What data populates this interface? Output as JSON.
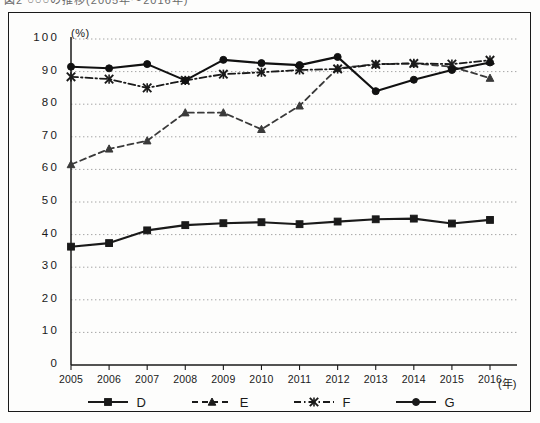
{
  "caption_sliver": "図2  ○○○の推移(2005年〜2016年)",
  "axis": {
    "y_unit": "(%)",
    "x_unit": "(年)",
    "y_ticks": [
      "100",
      "90",
      "80",
      "70",
      "60",
      "50",
      "40",
      "30",
      "20",
      "10",
      "0"
    ],
    "x_ticks": [
      "2005",
      "2006",
      "2007",
      "2008",
      "2009",
      "2010",
      "2011",
      "2012",
      "2013",
      "2014",
      "2015",
      "2016"
    ]
  },
  "legend": {
    "items": [
      {
        "label": "D",
        "marker": "square",
        "line": "solid"
      },
      {
        "label": "E",
        "marker": "triangle",
        "line": "dashed"
      },
      {
        "label": "F",
        "marker": "cross",
        "line": "dashdot"
      },
      {
        "label": "G",
        "marker": "circle",
        "line": "solid"
      }
    ]
  },
  "chart_data": {
    "type": "line",
    "title": "",
    "xlabel": "(年)",
    "ylabel": "(%)",
    "xlim": [
      2005,
      2016
    ],
    "ylim": [
      0,
      100
    ],
    "ytick_step": 10,
    "grid": true,
    "legend_position": "bottom",
    "categories": [
      "2005",
      "2006",
      "2007",
      "2008",
      "2009",
      "2010",
      "2011",
      "2012",
      "2013",
      "2014",
      "2015",
      "2016"
    ],
    "series": [
      {
        "name": "D",
        "marker": "square",
        "line": "solid",
        "color": "#1a1a1a",
        "values": [
          36.3,
          37.4,
          41.3,
          42.9,
          43.5,
          43.8,
          43.2,
          44.0,
          44.7,
          44.9,
          43.4,
          44.5
        ]
      },
      {
        "name": "E",
        "marker": "triangle",
        "line": "dashed",
        "color": "#3a3a3a",
        "values": [
          61.5,
          66.3,
          68.8,
          77.4,
          77.4,
          72.3,
          79.5,
          91.0,
          92.3,
          92.5,
          91.5,
          88.0
        ]
      },
      {
        "name": "F",
        "marker": "cross",
        "line": "dashdot",
        "color": "#1a1a1a",
        "values": [
          88.4,
          87.7,
          85.0,
          87.3,
          89.2,
          89.8,
          90.5,
          90.8,
          92.2,
          92.5,
          92.3,
          93.5
        ]
      },
      {
        "name": "G",
        "marker": "circle",
        "line": "solid",
        "color": "#111111",
        "values": [
          91.5,
          91.0,
          92.3,
          87.3,
          93.6,
          92.6,
          92.0,
          94.5,
          84.0,
          87.5,
          90.5,
          92.8
        ]
      }
    ]
  }
}
